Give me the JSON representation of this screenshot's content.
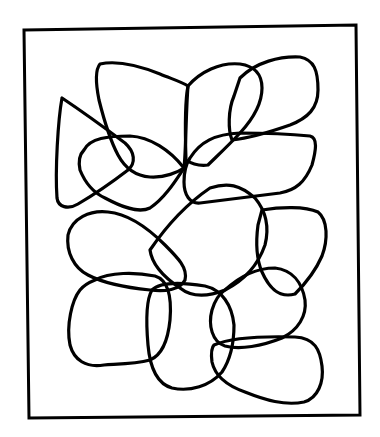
{
  "figure": {
    "background_color": "#ffffff",
    "stroke_color": "#000000",
    "frame": {
      "x1": 23,
      "y1": 28,
      "x2": 358,
      "y2": 416
    },
    "loop_count": 12
  }
}
